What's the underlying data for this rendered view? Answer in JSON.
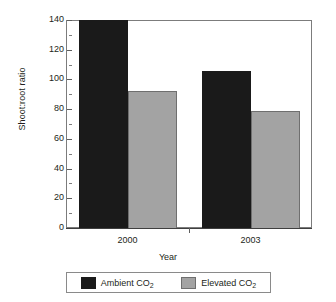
{
  "chart_data": {
    "type": "bar",
    "title": "",
    "xlabel": "Year",
    "ylabel": "Shoot:root ratio",
    "categories": [
      "2000",
      "2003"
    ],
    "series": [
      {
        "name": "Ambient CO2",
        "label_main": "Ambient CO",
        "label_sub": "2",
        "color": "#1a1a1a",
        "values": [
          140,
          106
        ]
      },
      {
        "name": "Elevated CO2",
        "label_main": "Elevated CO",
        "label_sub": "2",
        "color": "#a3a3a3",
        "values": [
          92,
          79
        ]
      }
    ],
    "ylim": [
      0,
      140
    ],
    "ytick_labels": [
      "0",
      "20",
      "40",
      "60",
      "80",
      "100",
      "120",
      "140"
    ],
    "ytick_values": [
      0,
      20,
      40,
      60,
      80,
      100,
      120,
      140
    ],
    "yminor_step": 10,
    "grid": false,
    "legend_position": "bottom"
  }
}
